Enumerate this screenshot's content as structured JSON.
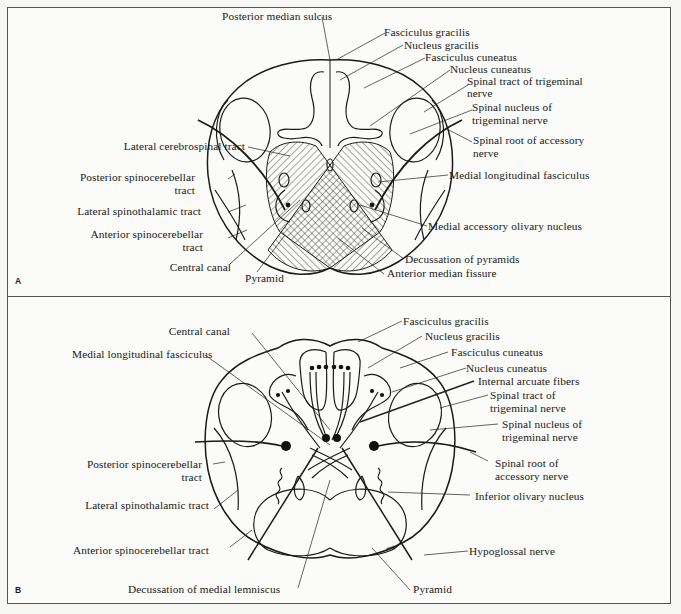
{
  "figure": {
    "panels": [
      {
        "letter": "A",
        "labels": {
          "posterior_median_sulcus": "Posterior median sulcus",
          "fasciculus_gracilis": "Fasciculus gracilis",
          "nucleus_gracilis": "Nucleus gracilis",
          "fasciculus_cuneatus": "Fasciculus cuneatus",
          "nucleus_cuneatus": "Nucleus cuneatus",
          "spinal_tract_trigeminal_1": "Spinal tract of trigeminal",
          "spinal_tract_trigeminal_2": "nerve",
          "spinal_nucleus_trigeminal_1": "Spinal nucleus of",
          "spinal_nucleus_trigeminal_2": "trigeminal nerve",
          "spinal_root_accessory_1": "Spinal root of accessory",
          "spinal_root_accessory_2": "nerve",
          "lateral_cerebrospinal_tract": "Lateral cerebrospinal tract",
          "posterior_spinocerebellar_1": "Posterior spinocerebellar",
          "posterior_spinocerebellar_2": "tract",
          "lateral_spinothalamic": "Lateral spinothalamic tract",
          "anterior_spinocerebellar_1": "Anterior spinocerebellar",
          "anterior_spinocerebellar_2": "tract",
          "central_canal": "Central canal",
          "pyramid": "Pyramid",
          "medial_longitudinal_fasciculus": "Medial longitudinal fasciculus",
          "medial_accessory_olivary": "Medial accessory olivary nucleus",
          "decussation_pyramids": "Decussation of pyramids",
          "anterior_median_fissure": "Anterior median fissure"
        }
      },
      {
        "letter": "B",
        "labels": {
          "central_canal": "Central canal",
          "medial_longitudinal_fasciculus": "Medial longitudinal fasciculus",
          "fasciculus_gracilis": "Fasciculus gracilis",
          "nucleus_gracilis": "Nucleus gracilis",
          "fasciculus_cuneatus": "Fasciculus cuneatus",
          "nucleus_cuneatus": "Nucleus cuneatus",
          "internal_arcuate_fibers": "Internal arcuate fibers",
          "spinal_tract_trigeminal_1": "Spinal tract of",
          "spinal_tract_trigeminal_2": "trigeminal nerve",
          "spinal_nucleus_trigeminal_1": "Spinal nucleus of",
          "spinal_nucleus_trigeminal_2": "trigeminal nerve",
          "posterior_spinocerebellar_1": "Posterior spinocerebellar",
          "posterior_spinocerebellar_2": "tract",
          "spinal_root_accessory_1": "Spinal root of",
          "spinal_root_accessory_2": "accessory nerve",
          "lateral_spinothalamic": "Lateral spinothalamic tract",
          "inferior_olivary_nucleus": "Inferior olivary nucleus",
          "anterior_spinocerebellar": "Anterior spinocerebellar tract",
          "hypoglossal_nerve": "Hypoglossal nerve",
          "decussation_medial_lemniscus": "Decussation of medial lemniscus",
          "pyramid": "Pyramid",
          "artist_signature": "mc"
        }
      }
    ]
  }
}
